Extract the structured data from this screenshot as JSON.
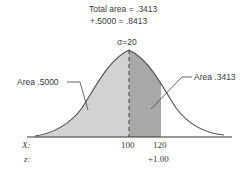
{
  "header": {
    "total_line1": "Total area = .3413",
    "total_line2": "+.5000 = .8413"
  },
  "sigma_label": "σ=20",
  "callouts": {
    "left": "Area .5000",
    "right": "Area .3413"
  },
  "axis": {
    "x_label": "X:",
    "z_label": "z:",
    "x_ticks": [
      "100",
      "120"
    ],
    "z_ticks": [
      "+1.00"
    ]
  },
  "colors": {
    "left_fill": "#d2d2d2",
    "right_fill": "#a8a8a8",
    "curve": "#555555"
  }
}
